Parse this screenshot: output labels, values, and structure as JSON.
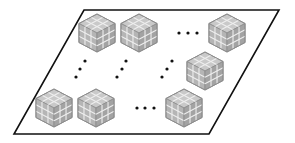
{
  "diagram": {
    "colors": {
      "background": "#ffffff",
      "board_stroke": "#111111",
      "cube_top": "#c9c9c9",
      "cube_left": "#b5b5b5",
      "cube_right": "#a3a3a3",
      "cube_grid": "#eeeeee",
      "cube_outline": "#8c8c8c",
      "dot": "#111111"
    },
    "board": {
      "points": [
        [
          84,
          10
        ],
        [
          279,
          10
        ],
        [
          209,
          134
        ],
        [
          14,
          134
        ]
      ]
    },
    "cube_size": 19,
    "cubes": [
      {
        "id": "r1c1",
        "cx": 97,
        "cy": 33
      },
      {
        "id": "r1c2",
        "cx": 139,
        "cy": 33
      },
      {
        "id": "r1cn",
        "cx": 227,
        "cy": 33
      },
      {
        "id": "r2cn",
        "cx": 205,
        "cy": 71
      },
      {
        "id": "r3c1",
        "cx": 54,
        "cy": 108
      },
      {
        "id": "r3c2",
        "cx": 96,
        "cy": 108
      },
      {
        "id": "r3cn",
        "cx": 184,
        "cy": 108
      }
    ],
    "ellipses": [
      {
        "id": "row1-h-ellipsis",
        "dots": [
          [
            179,
            33
          ],
          [
            188,
            33
          ],
          [
            197,
            33
          ]
        ]
      },
      {
        "id": "col1-v-ellipsis",
        "dots": [
          [
            85,
            61
          ],
          [
            80,
            69
          ],
          [
            76,
            77
          ]
        ]
      },
      {
        "id": "col2-v-ellipsis",
        "dots": [
          [
            126,
            61
          ],
          [
            122,
            69
          ],
          [
            117,
            77
          ]
        ]
      },
      {
        "id": "col3-v-ellipsis",
        "dots": [
          [
            172,
            61
          ],
          [
            167,
            69
          ],
          [
            162,
            77
          ]
        ]
      },
      {
        "id": "row3-h-ellipsis",
        "dots": [
          [
            137,
            108
          ],
          [
            145,
            108
          ],
          [
            154,
            108
          ]
        ]
      }
    ]
  }
}
